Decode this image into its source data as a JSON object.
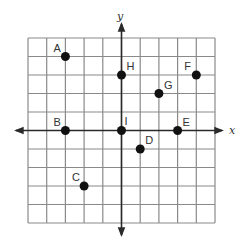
{
  "diagram": {
    "type": "coordinate-plane",
    "axes": {
      "x_label": "x",
      "y_label": "y"
    },
    "grid": {
      "x_min": -5,
      "x_max": 5,
      "y_min": -5,
      "y_max": 5,
      "step": 1
    },
    "colors": {
      "grid": "#8a8a8a",
      "axis": "#2a2a2a",
      "point": "#111111",
      "label": "#333333"
    },
    "points": [
      {
        "label": "A",
        "x": -3,
        "y": 4
      },
      {
        "label": "B",
        "x": -3,
        "y": 0
      },
      {
        "label": "C",
        "x": -2,
        "y": -3
      },
      {
        "label": "D",
        "x": 1,
        "y": -1
      },
      {
        "label": "E",
        "x": 3,
        "y": 0
      },
      {
        "label": "F",
        "x": 4,
        "y": 3
      },
      {
        "label": "G",
        "x": 2,
        "y": 2
      },
      {
        "label": "H",
        "x": 0,
        "y": 3
      },
      {
        "label": "I",
        "x": 0,
        "y": 0
      }
    ]
  }
}
